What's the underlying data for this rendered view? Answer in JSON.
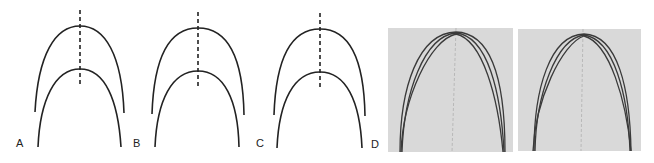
{
  "figure": {
    "panels": [
      {
        "id": "A",
        "label": "A",
        "type": "schematic",
        "description": "outer and inner arch forms with dashed midline"
      },
      {
        "id": "B",
        "label": "B",
        "type": "schematic",
        "description": "outer and inner arch forms with dashed midline"
      },
      {
        "id": "C",
        "label": "C",
        "type": "schematic",
        "description": "outer and inner arch forms with dashed midline"
      },
      {
        "id": "D",
        "label": "D",
        "type": "photograph",
        "description": "two photographs of superimposed archwires with midline"
      }
    ],
    "colors": {
      "line": "#222222",
      "photo_bg": "#d9d9d9",
      "wire": "#3a3a3a"
    }
  }
}
